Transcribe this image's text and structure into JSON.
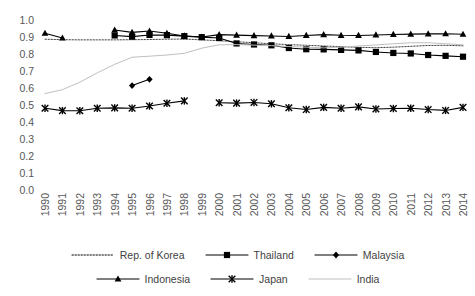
{
  "chart_data": {
    "type": "line",
    "title": "",
    "xlabel": "",
    "ylabel": "",
    "x": [
      1990,
      1991,
      1992,
      1993,
      1994,
      1995,
      1996,
      1997,
      1998,
      1999,
      2000,
      2001,
      2002,
      2003,
      2004,
      2005,
      2006,
      2007,
      2008,
      2009,
      2010,
      2011,
      2012,
      2013,
      2014
    ],
    "xlim": [
      1990,
      2014
    ],
    "ylim": [
      0.0,
      1.0
    ],
    "yticks": [
      "0.0",
      "0.1",
      "0.2",
      "0.3",
      "0.4",
      "0.5",
      "0.6",
      "0.7",
      "0.8",
      "0.9",
      "1.0"
    ],
    "xticks": [
      "1990",
      "1991",
      "1992",
      "1993",
      "1994",
      "1995",
      "1996",
      "1997",
      "1998",
      "1999",
      "2000",
      "2001",
      "2002",
      "2003",
      "2004",
      "2005",
      "2006",
      "2007",
      "2008",
      "2009",
      "2010",
      "2011",
      "2012",
      "2013",
      "2014"
    ],
    "grid": false,
    "legend_position": "bottom",
    "series": [
      {
        "name": "Rep. of Korea",
        "marker": "none",
        "line_style": "dotted",
        "color": "#404040",
        "values": [
          0.893,
          0.89,
          0.889,
          0.889,
          0.889,
          0.89,
          0.891,
          0.893,
          0.894,
          0.889,
          0.884,
          0.878,
          0.872,
          0.866,
          0.861,
          0.857,
          0.853,
          0.849,
          0.845,
          0.843,
          0.846,
          0.851,
          0.856,
          0.857,
          0.854
        ]
      },
      {
        "name": "Thailand",
        "marker": "square",
        "line_style": "solid",
        "color": "#000000",
        "values": [
          null,
          null,
          null,
          null,
          0.915,
          0.908,
          0.918,
          0.917,
          0.911,
          0.905,
          0.9,
          0.868,
          0.862,
          0.857,
          0.841,
          0.834,
          0.833,
          0.83,
          0.827,
          0.818,
          0.812,
          0.809,
          0.8,
          0.795,
          0.79
        ]
      },
      {
        "name": "Malaysia",
        "marker": "diamond",
        "line_style": "solid",
        "color": "#000000",
        "values": [
          null,
          null,
          null,
          null,
          null,
          0.62,
          0.657,
          null,
          null,
          null,
          null,
          null,
          null,
          null,
          null,
          null,
          null,
          null,
          null,
          null,
          null,
          null,
          null,
          null,
          null
        ]
      },
      {
        "name": "Indonesia",
        "marker": "triangle",
        "line_style": "solid",
        "color": "#000000",
        "values": [
          0.928,
          0.9,
          null,
          null,
          0.947,
          0.933,
          0.941,
          0.928,
          0.912,
          0.906,
          0.92,
          0.917,
          0.914,
          0.912,
          0.909,
          0.915,
          0.92,
          0.916,
          0.915,
          0.918,
          0.921,
          0.923,
          0.924,
          0.925,
          0.922
        ]
      },
      {
        "name": "Japan",
        "marker": "asterisk",
        "line_style": "solid",
        "color": "#000000",
        "values": [
          0.487,
          0.473,
          0.472,
          0.487,
          0.489,
          0.487,
          0.5,
          0.516,
          0.53,
          null,
          0.519,
          0.517,
          0.521,
          0.513,
          0.49,
          0.479,
          0.492,
          0.487,
          0.495,
          0.482,
          0.485,
          0.487,
          0.479,
          0.474,
          0.492
        ]
      },
      {
        "name": "India",
        "marker": "none",
        "line_style": "solid-light",
        "color": "#bfbfbf",
        "values": [
          0.573,
          0.596,
          0.64,
          0.695,
          0.745,
          0.787,
          0.793,
          0.8,
          0.81,
          0.84,
          0.86,
          0.861,
          0.858,
          0.855,
          0.85,
          0.846,
          0.842,
          0.846,
          0.853,
          0.859,
          0.866,
          0.872,
          0.872,
          0.866,
          0.86
        ]
      }
    ]
  },
  "legend": {
    "items": [
      {
        "label": "Rep. of Korea",
        "style": "dotted",
        "marker": "none"
      },
      {
        "label": "Thailand",
        "style": "solid",
        "marker": "square"
      },
      {
        "label": "Malaysia",
        "style": "solid",
        "marker": "diamond"
      },
      {
        "label": "Indonesia",
        "style": "solid",
        "marker": "triangle"
      },
      {
        "label": "Japan",
        "style": "solid",
        "marker": "asterisk"
      },
      {
        "label": "India",
        "style": "solid-light",
        "marker": "none"
      }
    ]
  },
  "colors": {
    "axis_text": "#575757",
    "legend_text": "#3f3f3f",
    "series_dark": "#000000",
    "series_light": "#bfbfbf",
    "background": "#ffffff"
  }
}
